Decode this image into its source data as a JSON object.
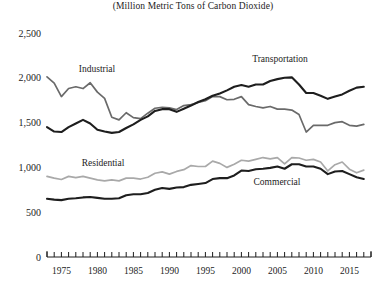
{
  "chart": {
    "subtitle": "(Million Metric Tons of Carbon Dioxide)",
    "title": ""
  },
  "axis": {
    "y_ticks": [
      "0",
      "500",
      "1,000",
      "1,500",
      "2,000",
      "2,500"
    ],
    "x_ticks": [
      "1975",
      "1980",
      "1985",
      "1990",
      "1995",
      "2000",
      "2005",
      "2010",
      "2015"
    ]
  },
  "labels": {
    "industrial": "Industrial",
    "transportation": "Transportation",
    "residential": "Residential",
    "commercial": "Commercial"
  },
  "colors": {
    "transportation": "#1e1e1e",
    "industrial": "#6a6a6a",
    "residential": "#a9a9a9",
    "commercial": "#1e1e1e"
  },
  "chart_data": {
    "type": "line",
    "title": "",
    "subtitle": "(Million Metric Tons of Carbon Dioxide)",
    "xlabel": "",
    "ylabel": "",
    "ylim": [
      0,
      2500
    ],
    "xlim": [
      1973,
      2018
    ],
    "grid": false,
    "legend": "inline-annotations",
    "yticks": [
      0,
      500,
      1000,
      1500,
      2000,
      2500
    ],
    "xticks": [
      1975,
      1980,
      1985,
      1990,
      1995,
      2000,
      2005,
      2010,
      2015
    ],
    "x": [
      1973,
      1974,
      1975,
      1976,
      1977,
      1978,
      1979,
      1980,
      1981,
      1982,
      1983,
      1984,
      1985,
      1986,
      1987,
      1988,
      1989,
      1990,
      1991,
      1992,
      1993,
      1994,
      1995,
      1996,
      1997,
      1998,
      1999,
      2000,
      2001,
      2002,
      2003,
      2004,
      2005,
      2006,
      2007,
      2008,
      2009,
      2010,
      2011,
      2012,
      2013,
      2014,
      2015,
      2016,
      2017
    ],
    "series": [
      {
        "name": "Industrial",
        "color": "#6a6a6a",
        "values": [
          2010,
          1940,
          1790,
          1880,
          1900,
          1880,
          1945,
          1840,
          1770,
          1560,
          1530,
          1610,
          1555,
          1545,
          1605,
          1660,
          1670,
          1665,
          1645,
          1690,
          1700,
          1725,
          1745,
          1790,
          1790,
          1755,
          1760,
          1790,
          1700,
          1680,
          1665,
          1680,
          1650,
          1650,
          1640,
          1590,
          1395,
          1470,
          1470,
          1470,
          1500,
          1510,
          1470,
          1460,
          1480
        ]
      },
      {
        "name": "Transportation",
        "color": "#1e1e1e",
        "values": [
          1450,
          1400,
          1395,
          1450,
          1490,
          1530,
          1490,
          1420,
          1400,
          1385,
          1395,
          1440,
          1480,
          1530,
          1570,
          1630,
          1650,
          1650,
          1620,
          1655,
          1690,
          1730,
          1760,
          1800,
          1825,
          1860,
          1900,
          1920,
          1900,
          1925,
          1925,
          1965,
          1985,
          2000,
          2005,
          1925,
          1830,
          1830,
          1800,
          1765,
          1790,
          1815,
          1855,
          1890,
          1900
        ]
      },
      {
        "name": "Residential",
        "color": "#a9a9a9",
        "values": [
          900,
          880,
          865,
          900,
          885,
          900,
          880,
          860,
          850,
          860,
          850,
          880,
          880,
          870,
          890,
          935,
          950,
          925,
          955,
          975,
          1020,
          1010,
          1010,
          1070,
          1045,
          1000,
          1035,
          1080,
          1070,
          1090,
          1110,
          1095,
          1110,
          1040,
          1110,
          1105,
          1080,
          1090,
          1060,
          960,
          1030,
          1060,
          980,
          940,
          970
        ]
      },
      {
        "name": "Commercial",
        "color": "#1e1e1e",
        "values": [
          650,
          640,
          635,
          650,
          655,
          665,
          670,
          660,
          650,
          650,
          655,
          690,
          700,
          700,
          715,
          750,
          770,
          760,
          775,
          780,
          805,
          815,
          825,
          870,
          880,
          880,
          910,
          965,
          960,
          980,
          985,
          995,
          1010,
          985,
          1035,
          1035,
          1010,
          1010,
          985,
          925,
          955,
          960,
          925,
          890,
          870
        ]
      }
    ]
  },
  "geometry": {
    "plot_left": 47,
    "plot_right": 371,
    "y_zero_px": 257,
    "y_scale_px_per_unit": 0.09
  }
}
